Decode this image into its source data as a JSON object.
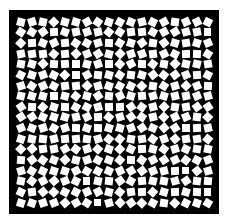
{
  "figure": {
    "background_color": "#000000",
    "tile_color": "#ffffff",
    "rows": 18,
    "cols": 18
  }
}
